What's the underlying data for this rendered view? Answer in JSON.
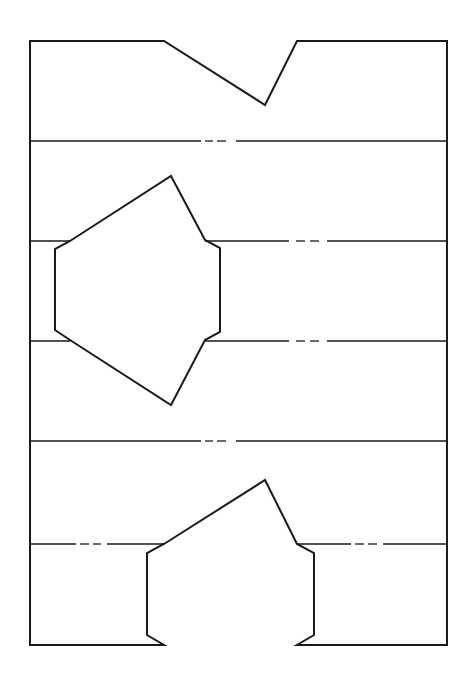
{
  "diagram": {
    "type": "paper-cut-template",
    "width": 473,
    "height": 681,
    "stroke_color": "#1a1a1a",
    "background": "#ffffff",
    "outline_path": "M30,41 L164,41 L265,105 L297,41 L447,41 L447,645 L297,645 L314,635 L314,553 L297,544 L265,480 L164,544 L147,553 L147,635 L164,645 L30,645 Z",
    "hexagon_path": "M171,176 L205,240 L220,248 L220,332 L205,340 L171,405 L70,340 L55,330 L55,249 L70,241 Z",
    "fold_lines": [
      {
        "id": "fold-1",
        "segments": [
          [
            30,
            141,
            201,
            141
          ],
          [
            205,
            141,
            213,
            141
          ],
          [
            217,
            141,
            226,
            141
          ],
          [
            236,
            141,
            447,
            141
          ]
        ]
      },
      {
        "id": "fold-2",
        "segments": [
          [
            30,
            241,
            70,
            241
          ],
          [
            205,
            241,
            289,
            241
          ],
          [
            296,
            241,
            305,
            241
          ],
          [
            310,
            241,
            319,
            241
          ],
          [
            327,
            241,
            447,
            241
          ]
        ]
      },
      {
        "id": "fold-3",
        "segments": [
          [
            30,
            341,
            70,
            341
          ],
          [
            205,
            341,
            289,
            341
          ],
          [
            296,
            341,
            305,
            341
          ],
          [
            310,
            341,
            319,
            341
          ],
          [
            327,
            341,
            447,
            341
          ]
        ]
      },
      {
        "id": "fold-4",
        "segments": [
          [
            30,
            441,
            201,
            441
          ],
          [
            205,
            441,
            213,
            441
          ],
          [
            217,
            441,
            226,
            441
          ],
          [
            236,
            441,
            447,
            441
          ]
        ]
      },
      {
        "id": "fold-5",
        "segments": [
          [
            30,
            544,
            76,
            544
          ],
          [
            80,
            544,
            89,
            544
          ],
          [
            93,
            544,
            101,
            544
          ],
          [
            107,
            544,
            164,
            544
          ],
          [
            297,
            544,
            351,
            544
          ],
          [
            355,
            544,
            364,
            544
          ],
          [
            368,
            544,
            377,
            544
          ],
          [
            383,
            544,
            447,
            544
          ]
        ]
      }
    ]
  }
}
